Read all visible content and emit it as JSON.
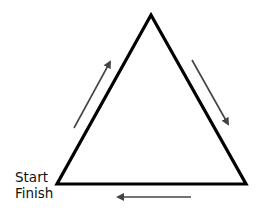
{
  "diagram": {
    "type": "cycle-triangle",
    "labels": {
      "start": "Start",
      "finish": "Finish"
    },
    "triangle": {
      "apex": [
        151,
        15
      ],
      "bottom_left": [
        57,
        184
      ],
      "bottom_right": [
        246,
        184
      ],
      "stroke_color": "#000000"
    },
    "arrows": [
      {
        "name": "up-left-side",
        "from": [
          74,
          128
        ],
        "to": [
          111,
          60
        ]
      },
      {
        "name": "down-right-side",
        "from": [
          192,
          60
        ],
        "to": [
          229,
          126
        ]
      },
      {
        "name": "left-bottom-side",
        "from": [
          191,
          197
        ],
        "to": [
          116,
          197
        ]
      }
    ],
    "arrow_color": "#444444"
  }
}
